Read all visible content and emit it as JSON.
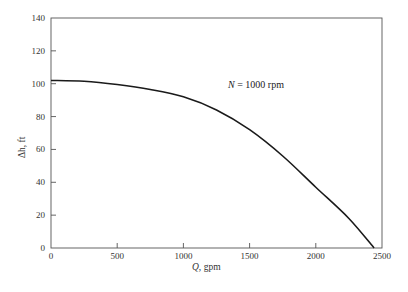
{
  "chart_data": {
    "type": "line",
    "title": "",
    "xlabel": "Q, gpm",
    "ylabel": "Δh, ft",
    "xlim": [
      0,
      2500
    ],
    "ylim": [
      0,
      140
    ],
    "xticks": [
      0,
      500,
      1000,
      1500,
      2000,
      2500
    ],
    "yticks": [
      0,
      20,
      40,
      60,
      80,
      100,
      120,
      140
    ],
    "grid": false,
    "legend": null,
    "annotations": [
      {
        "text": "N = 1000 rpm",
        "x": 1350,
        "y": 100
      }
    ],
    "series": [
      {
        "name": "N = 1000 rpm",
        "x": [
          0,
          250,
          500,
          750,
          1000,
          1250,
          1500,
          1750,
          2000,
          2250,
          2440
        ],
        "y": [
          102,
          101.5,
          99.5,
          96.5,
          92,
          84,
          72,
          56,
          37,
          18,
          0
        ]
      }
    ]
  },
  "labels": {
    "xlabel_q": "Q,",
    "xlabel_unit": " gpm",
    "ylabel": "Δh, ft",
    "annot_n": "N",
    "annot_rest": " =  1000  rpm"
  },
  "ticks": {
    "x": [
      "0",
      "500",
      "1000",
      "1500",
      "2000",
      "2500"
    ],
    "y": [
      "0",
      "20",
      "40",
      "60",
      "80",
      "100",
      "120",
      "140"
    ]
  }
}
